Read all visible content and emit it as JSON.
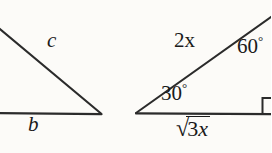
{
  "figure": {
    "kind": "geometry-diagram",
    "background_color": "#fcfbf8",
    "stroke_color": "#2b2b2b",
    "text_color": "#1a1a1a"
  },
  "left_triangle": {
    "name": "left-partial-triangle",
    "labels": {
      "hypotenuse": "c",
      "base": "b"
    },
    "geometry": {
      "hypotenuse_start": [
        0,
        29
      ],
      "hypotenuse_end": [
        100,
        113
      ],
      "base_start": [
        0,
        113
      ],
      "base_end": [
        101,
        114
      ]
    }
  },
  "right_triangle": {
    "name": "right-triangle-30-60-90",
    "labels": {
      "hypotenuse": "2x",
      "angle_top": "60",
      "angle_left": "30",
      "base_radical": "√",
      "base_radicand_number": "3",
      "base_radicand_variable": "x",
      "degree_symbol": "°"
    },
    "geometry": {
      "apex_left": [
        137,
        113
      ],
      "hypotenuse_end": [
        271,
        17
      ],
      "base_start": [
        137,
        113
      ],
      "base_end": [
        271,
        114
      ],
      "right_angle_marker": [
        262,
        98
      ]
    }
  }
}
